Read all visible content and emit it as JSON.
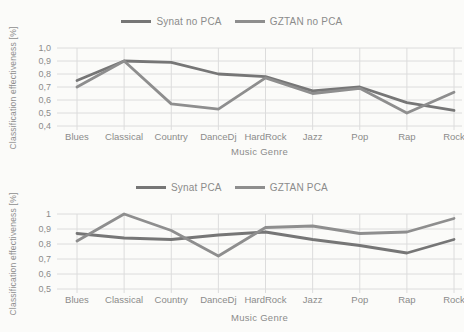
{
  "figure": {
    "description_top_legend": [
      "Synat no PCA",
      "GZTAN no PCA"
    ],
    "description_bottom_legend": [
      "Synat PCA",
      "GZTAN PCA"
    ]
  },
  "colors": {
    "grid": "#dcdcdc",
    "text": "#8b8b8b",
    "background": "#fbfbf9"
  },
  "chart_data": [
    {
      "type": "line",
      "title": "",
      "categories": [
        "Blues",
        "Classical",
        "Country",
        "DanceDj",
        "HardRock",
        "Jazz",
        "Pop",
        "Rap",
        "Rock"
      ],
      "series": [
        {
          "name": "Synat no PCA",
          "color": "#767676",
          "values": [
            0.75,
            0.9,
            0.89,
            0.8,
            0.78,
            0.67,
            0.7,
            0.58,
            0.52
          ]
        },
        {
          "name": "GZTAN no PCA",
          "color": "#8e8e8e",
          "values": [
            0.7,
            0.9,
            0.57,
            0.53,
            0.77,
            0.65,
            0.69,
            0.5,
            0.66
          ]
        }
      ],
      "xlabel": "Music Genre",
      "ylabel": "Classification effectiveness [%]",
      "ylim": [
        0.4,
        1.0
      ],
      "ytick_labels": [
        "1,0",
        "0,9",
        "0,8",
        "0,7",
        "0,6",
        "0,5",
        "0,4"
      ],
      "grid": true,
      "legend_position": "top"
    },
    {
      "type": "line",
      "title": "",
      "categories": [
        "Blues",
        "Classical",
        "Country",
        "DanceDj",
        "HardRock",
        "Jazz",
        "Pop",
        "Rap",
        "Rock"
      ],
      "series": [
        {
          "name": "Synat PCA",
          "color": "#767676",
          "values": [
            0.87,
            0.84,
            0.83,
            0.86,
            0.88,
            0.83,
            0.79,
            0.74,
            0.83
          ]
        },
        {
          "name": "GZTAN PCA",
          "color": "#8e8e8e",
          "values": [
            0.82,
            1.0,
            0.89,
            0.72,
            0.91,
            0.92,
            0.87,
            0.88,
            0.97
          ]
        }
      ],
      "xlabel": "Music Genre",
      "ylabel": "Classification effectiveness [%]",
      "ylim": [
        0.5,
        1.0
      ],
      "ytick_labels": [
        "1",
        "0,9",
        "0,8",
        "0,7",
        "0,6",
        "0,5"
      ],
      "grid": true,
      "legend_position": "top"
    }
  ]
}
